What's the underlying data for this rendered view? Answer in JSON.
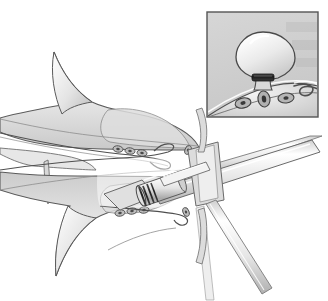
{
  "figure": {
    "type": "medical-illustration",
    "style": "grayscale line-and-wash anatomical drawing",
    "background_color": "#ffffff",
    "width": 328,
    "height": 301
  },
  "palette": {
    "outline": "#4a4a4a",
    "outline_soft": "#6e6e6e",
    "tissue_light": "#f2f2f2",
    "tissue_mid": "#dcdcdc",
    "tissue_dark": "#c2c2c2",
    "lumen_white": "#ffffff",
    "gland_fill": "#b4b4b4",
    "gland_core": "#4f4f4f",
    "band_dark": "#2b2b2b",
    "metal_light": "#fafafa",
    "metal_mid": "#d6d6d6",
    "metal_shadow": "#9a9a9a",
    "inset_background": "#d2d2d2",
    "inset_border": "#555555"
  },
  "main_scene": {
    "name": "cross-sectional view of hollow viscus lumen with ligation device",
    "parts": [
      {
        "name": "upper-mucosal-wall",
        "description": "upper tissue fold bounding the lumen"
      },
      {
        "name": "lower-mucosal-wall",
        "description": "lower tissue fold bounding the lumen"
      },
      {
        "name": "upper-submucosal-glands",
        "description": "row of small oval glands in upper wall"
      },
      {
        "name": "lower-submucosal-glands",
        "description": "row of small oval glands in lower wall"
      },
      {
        "name": "lumen-cavity",
        "description": "open white central channel"
      },
      {
        "name": "ligation-cylinder",
        "description": "transparent banding cap at endoscope tip"
      },
      {
        "name": "elastic-bands",
        "description": "dark preloaded elastic rings on cylinder"
      },
      {
        "name": "endoscope-shaft",
        "description": "long shaft entering from upper right"
      },
      {
        "name": "inner-probe",
        "description": "thin instrument inside the cylinder"
      },
      {
        "name": "accessory-instrument",
        "description": "second shaft exiting to lower right"
      }
    ]
  },
  "inset_panel": {
    "name": "magnified detail of banded polyp",
    "bounds": {
      "x": 207,
      "y": 12,
      "width": 111,
      "height": 105
    },
    "parts": [
      {
        "name": "polyp-head",
        "description": "rounded bulbous polyp head"
      },
      {
        "name": "polyp-stalk",
        "description": "narrow pedicle beneath the head"
      },
      {
        "name": "ligature-band",
        "description": "dark elastic band constricting the stalk base"
      },
      {
        "name": "mucosal-surface",
        "description": "sloping mucosal layer the polyp arises from"
      },
      {
        "name": "submucosal-glands",
        "count": 3,
        "description": "three oval glands within submucosa"
      },
      {
        "name": "coiled-vessel",
        "description": "curling vessel or duct at right of mucosa"
      }
    ]
  },
  "labels": {
    "present": false,
    "text_items": []
  }
}
